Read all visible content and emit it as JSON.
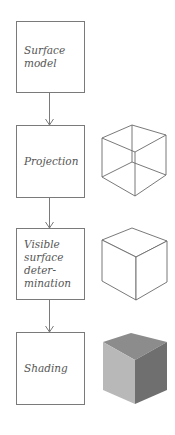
{
  "diagram": {
    "stages": [
      {
        "label": "Surface\nmodel",
        "illustration": "none"
      },
      {
        "label": "Projection",
        "illustration": "wireframe-cube"
      },
      {
        "label": "Visible\nsurface\ndeter-\nmination",
        "illustration": "hidden-line-cube"
      },
      {
        "label": "Shading",
        "illustration": "shaded-cube"
      }
    ],
    "colors": {
      "line": "#7a7a7a",
      "text": "#555555",
      "cube_top": "#8c8c8c",
      "cube_left": "#b8b8b8",
      "cube_right": "#6f6f6f"
    }
  }
}
